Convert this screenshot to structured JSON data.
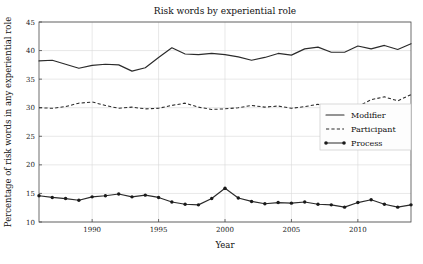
{
  "chart_data": {
    "type": "line",
    "title": "Risk words by experiential role",
    "xlabel": "Year",
    "ylabel": "Percentage of risk words in any experiential role",
    "xlim": [
      1986,
      2014
    ],
    "ylim": [
      10,
      45
    ],
    "xticks": [
      1990,
      1995,
      2000,
      2005,
      2010
    ],
    "yticks": [
      10,
      15,
      20,
      25,
      30,
      35,
      40,
      45
    ],
    "grid": true,
    "legend_position": "right-center",
    "x": [
      1986,
      1987,
      1988,
      1989,
      1990,
      1991,
      1992,
      1993,
      1994,
      1995,
      1996,
      1997,
      1998,
      1999,
      2000,
      2001,
      2002,
      2003,
      2004,
      2005,
      2006,
      2007,
      2008,
      2009,
      2010,
      2011,
      2012,
      2013,
      2014
    ],
    "series": [
      {
        "name": "Modifier",
        "style": "solid",
        "marker": "none",
        "values": [
          38.2,
          38.3,
          37.6,
          36.9,
          37.4,
          37.6,
          37.5,
          36.4,
          37.0,
          38.8,
          40.5,
          39.4,
          39.3,
          39.5,
          39.3,
          38.9,
          38.3,
          38.8,
          39.5,
          39.2,
          40.3,
          40.6,
          39.7,
          39.7,
          40.8,
          40.3,
          40.9,
          40.2,
          41.2
        ]
      },
      {
        "name": "Participant",
        "style": "dashed",
        "marker": "none",
        "values": [
          30.0,
          29.9,
          30.2,
          30.8,
          31.0,
          30.4,
          29.9,
          30.1,
          29.8,
          29.9,
          30.4,
          30.8,
          30.1,
          29.7,
          29.8,
          30.0,
          30.4,
          30.1,
          30.3,
          29.9,
          30.2,
          30.6,
          29.8,
          29.4,
          30.2,
          31.4,
          31.9,
          31.2,
          32.3
        ]
      },
      {
        "name": "Process",
        "style": "solid",
        "marker": "circle",
        "values": [
          14.6,
          14.3,
          14.1,
          13.8,
          14.4,
          14.6,
          14.9,
          14.4,
          14.7,
          14.3,
          13.5,
          13.1,
          13.0,
          14.1,
          15.9,
          14.2,
          13.6,
          13.2,
          13.4,
          13.3,
          13.5,
          13.1,
          13.0,
          12.6,
          13.4,
          13.9,
          13.1,
          12.6,
          13.0
        ]
      }
    ]
  }
}
